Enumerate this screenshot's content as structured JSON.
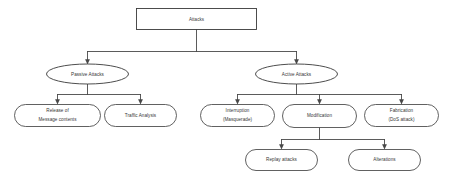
{
  "diagram": {
    "title": "Attacks",
    "type": "tree-taxonomy",
    "background_color": "#ffffff",
    "stroke_color": "#3d3d3d",
    "text_color": "#2b2b2b",
    "nodes": {
      "root": {
        "label": "Attacks",
        "shape": "rectangle"
      },
      "passive": {
        "label": "Passive Attacks",
        "shape": "ellipse"
      },
      "active": {
        "label": "Active Attacks",
        "shape": "ellipse"
      },
      "release": {
        "label_line1": "Release of",
        "label_line2": "Message contents",
        "shape": "stadium"
      },
      "traffic": {
        "label": "Traffic Analysis",
        "shape": "stadium"
      },
      "interruption": {
        "label_line1": "Interruption",
        "label_line2": "(Masquerade)",
        "shape": "stadium"
      },
      "modification": {
        "label": "Modification",
        "shape": "stadium"
      },
      "fabrication": {
        "label_line1": "Fabrication",
        "label_line2": "(DoS attack)",
        "shape": "stadium"
      },
      "replay": {
        "label": "Replay attacks",
        "shape": "stadium"
      },
      "alterations": {
        "label": "Alterations",
        "shape": "stadium"
      }
    }
  }
}
